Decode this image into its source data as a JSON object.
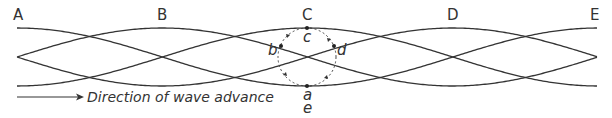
{
  "diagram": {
    "colors": {
      "stroke": "#333333",
      "background": "#ffffff"
    },
    "geometry": {
      "x_start": 17,
      "x_end": 598,
      "y_top": 28,
      "y_mid": 57,
      "y_bottom": 86,
      "period_px": 581
    },
    "position_labels": [
      {
        "text": "A",
        "x": 17
      },
      {
        "text": "B",
        "x": 162
      },
      {
        "text": "C",
        "x": 307
      },
      {
        "text": "D",
        "x": 452
      },
      {
        "text": "E",
        "x": 597
      }
    ],
    "orbit": {
      "center_x": 307,
      "center_y": 57,
      "radius": 29,
      "points": [
        {
          "text": "c",
          "x": 307,
          "y": 28
        },
        {
          "text": "b",
          "x": 281,
          "y": 46
        },
        {
          "text": "d",
          "x": 334,
          "y": 46
        },
        {
          "text": "a",
          "x": 307,
          "y": 86
        },
        {
          "text": "e",
          "x": 307,
          "y": 86
        }
      ]
    },
    "caption": {
      "text": "Direction of wave advance"
    }
  }
}
